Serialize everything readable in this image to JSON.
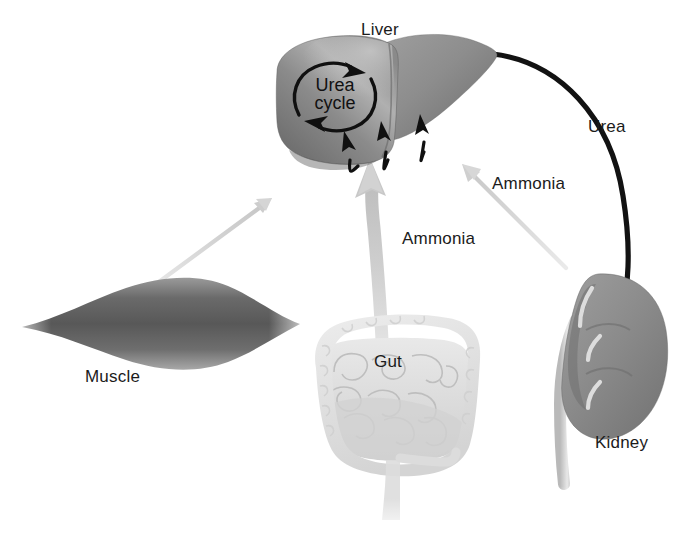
{
  "figure": {
    "kind": "biological-pathway-diagram",
    "background_color": "#ffffff"
  },
  "organs": [
    {
      "id": "liver",
      "label": "Liver",
      "fill": "#8a8a8a",
      "shade": "#6e6e6e",
      "highlight": "#bdbdbd"
    },
    {
      "id": "muscle",
      "label": "Muscle",
      "fill": "#757575",
      "shade": "#4f4f4f",
      "highlight": "#cfcfcf"
    },
    {
      "id": "gut",
      "label": "Gut",
      "fill": "#e3e3e3",
      "shade": "#cccccc",
      "highlight": "#f4f4f4"
    },
    {
      "id": "kidney",
      "label": "Kidney",
      "fill": "#8d8d8d",
      "shade": "#6b6b6b",
      "highlight": "#e6e6e6"
    }
  ],
  "labels": {
    "liver": "Liver",
    "muscle": "Muscle",
    "gut": "Gut",
    "kidney": "Kidney",
    "urea": "Urea",
    "ammonia_from_kidney": "Ammonia",
    "ammonia_from_gut": "Ammonia",
    "urea_cycle_line1": "Urea",
    "urea_cycle_line2": "cycle"
  },
  "flows": [
    {
      "id": "muscle-to-liver",
      "from": "muscle",
      "to": "liver",
      "substance": "",
      "style": "thin-gray-arrow",
      "color": "#d8d8d8"
    },
    {
      "id": "gut-to-liver",
      "from": "gut",
      "to": "liver",
      "substance": "Ammonia",
      "style": "thick-gray-curved-arrow",
      "color": "#c9c9c9"
    },
    {
      "id": "kidney-to-liver",
      "from": "kidney",
      "to": "liver",
      "substance": "Ammonia",
      "style": "thin-gray-arrow",
      "color": "#dadada"
    },
    {
      "id": "liver-to-kidney",
      "from": "liver",
      "to": "kidney",
      "substance": "Urea",
      "style": "thick-black-curved-arrow",
      "color": "#111111"
    },
    {
      "id": "inflow-arrow-1",
      "from": "",
      "to": "liver",
      "substance": "",
      "style": "small-black-curved-arrow",
      "color": "#111111"
    },
    {
      "id": "inflow-arrow-2",
      "from": "",
      "to": "liver",
      "substance": "",
      "style": "small-black-curved-arrow",
      "color": "#111111"
    },
    {
      "id": "inflow-arrow-3",
      "from": "",
      "to": "liver",
      "substance": "",
      "style": "small-black-curved-arrow",
      "color": "#111111"
    },
    {
      "id": "urea-cycle-loop",
      "from": "liver",
      "to": "liver",
      "substance": "Urea cycle",
      "style": "black-circular-arrows",
      "color": "#111111"
    }
  ]
}
